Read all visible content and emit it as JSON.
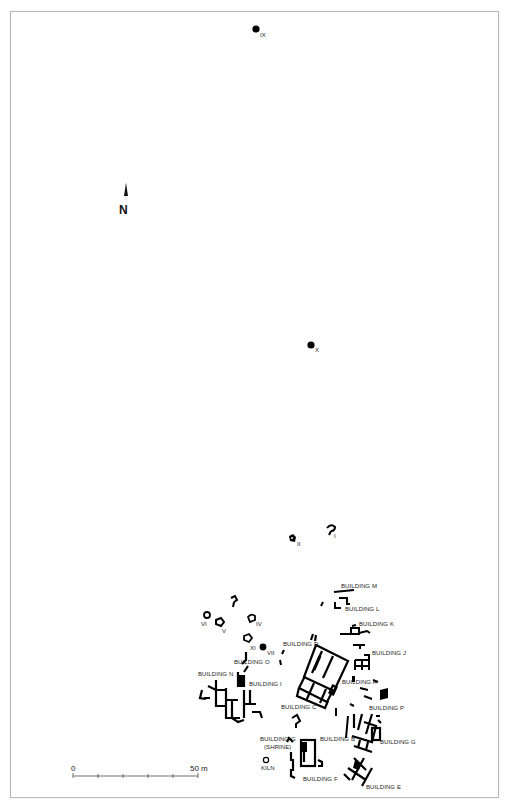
{
  "map": {
    "north_label": "N",
    "points": [
      {
        "id": "IX",
        "label": "IX",
        "type": "filled"
      },
      {
        "id": "X",
        "label": "X",
        "type": "filled"
      },
      {
        "id": "VII",
        "label": "VII",
        "type": "filled"
      }
    ],
    "features": [
      {
        "id": "I",
        "label": "I"
      },
      {
        "id": "II",
        "label": "II"
      },
      {
        "id": "IV",
        "label": "IV"
      },
      {
        "id": "V",
        "label": "V"
      },
      {
        "id": "VI",
        "label": "VI"
      },
      {
        "id": "XI",
        "label": "XI"
      },
      {
        "id": "kiln",
        "label": "KILN"
      }
    ],
    "buildings": {
      "M": "BUILDING M",
      "L": "BUILDING L",
      "K": "BUILDING K",
      "J": "BUILDING J",
      "D": "BUILDING D",
      "O": "BUILDING O",
      "N": "BUILDING N",
      "I": "BUILDING I",
      "A": "BUILDING A",
      "C": "BUILDING C",
      "P": "BUILDING P",
      "G_shrine": "BUILDING G",
      "shrine_note": "(SHRINE)",
      "B": "BUILDING B",
      "G": "BUILDING G",
      "F": "BUILDING F",
      "E": "BUILDING E"
    },
    "scale_bar": {
      "start_label": "0",
      "end_label": "50 m",
      "length_m": 50,
      "divisions": 5
    }
  }
}
